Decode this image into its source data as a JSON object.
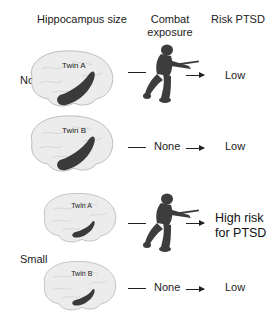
{
  "headers": {
    "hippocampus": "Hippocampus size",
    "combat": "Combat\nexposure",
    "combat_line1": "Combat",
    "combat_line2": "exposure",
    "risk": "Risk PTSD"
  },
  "groups": [
    {
      "label": "Normal",
      "hippocampus_size": "normal",
      "twins": [
        {
          "name": "Twin A",
          "combat_exposure": "soldier-icon",
          "risk": "Low"
        },
        {
          "name": "Twin B",
          "combat_exposure": "None",
          "risk": "Low"
        }
      ]
    },
    {
      "label": "Small",
      "hippocampus_size": "small",
      "twins": [
        {
          "name": "Twin A",
          "combat_exposure": "soldier-icon",
          "risk": "High risk for PTSD",
          "risk_line1": "High risk",
          "risk_line2": "for PTSD"
        },
        {
          "name": "Twin B",
          "combat_exposure": "None",
          "risk": "Low"
        }
      ]
    }
  ],
  "colors": {
    "brain_fill": "#e9e9e9",
    "brain_stroke": "#bdbdbd",
    "hippocampus": "#3a3a3a",
    "soldier": "#3d3d3d",
    "text": "#222222"
  }
}
